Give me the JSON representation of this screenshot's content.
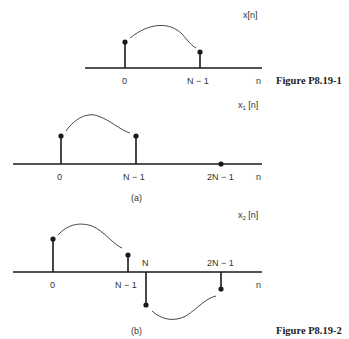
{
  "figure1": {
    "signal_label": "x[n]",
    "axis_label": "n",
    "ticks": [
      "0",
      "N − 1"
    ],
    "caption": "Figure P8.19-1"
  },
  "figure2a": {
    "signal_label_base": "x",
    "signal_label_sub": "1",
    "signal_label_arg": " [n]",
    "axis_label": "n",
    "ticks": [
      "0",
      "N − 1",
      "2N − 1"
    ],
    "panel_label": "(a)"
  },
  "figure2b": {
    "signal_label_base": "x",
    "signal_label_sub": "2",
    "signal_label_arg": " [n]",
    "axis_label": "n",
    "ticks_below": [
      "0",
      "N − 1"
    ],
    "ticks_above": [
      "N",
      "2N − 1"
    ],
    "panel_label": "(b)",
    "caption": "Figure P8.19-2"
  },
  "colors": {
    "ink": "#1a1a1a",
    "background": "#ffffff"
  }
}
